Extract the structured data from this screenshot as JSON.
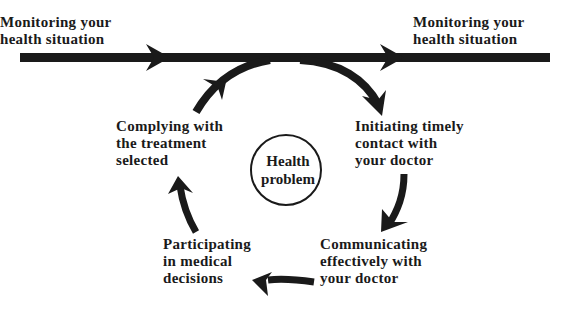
{
  "diagram": {
    "type": "cycle-flow",
    "colors": {
      "ink": "#1a1a1a",
      "background": "#ffffff"
    },
    "timeline": {
      "start_label": "Monitoring your\nhealth situation",
      "end_label": "Monitoring your\nhealth situation"
    },
    "center": {
      "label": "Health\nproblem"
    },
    "steps": [
      {
        "label": "Initiating timely\ncontact with\nyour doctor"
      },
      {
        "label": "Communicating\neffectively with\nyour doctor"
      },
      {
        "label": "Participating\nin medical\ndecisions"
      },
      {
        "label": "Complying with\nthe treatment\nselected"
      }
    ]
  }
}
